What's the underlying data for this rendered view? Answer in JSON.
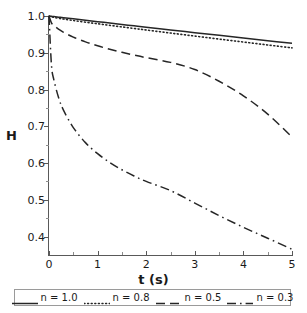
{
  "chart_data": {
    "type": "line",
    "title": "",
    "xlabel": "t (s)",
    "ylabel": "H",
    "xlim": [
      0,
      5
    ],
    "ylim": [
      0.35,
      1.0
    ],
    "grid": false,
    "legend_position": "bottom",
    "xticks": [
      "0",
      "1",
      "2",
      "3",
      "4",
      "5"
    ],
    "xtick_values": [
      0,
      1,
      2,
      3,
      4,
      5
    ],
    "yticks": [
      "0.4",
      "0.5",
      "0.6",
      "0.7",
      "0.8",
      "0.9",
      "1.0"
    ],
    "ytick_values": [
      0.4,
      0.5,
      0.6,
      0.7,
      0.8,
      0.9,
      1.0
    ],
    "x": [
      0,
      0.05,
      0.1,
      0.2,
      0.3,
      0.5,
      0.75,
      1.0,
      1.25,
      1.5,
      1.75,
      2.0,
      2.5,
      3.0,
      3.5,
      4.0,
      4.5,
      5.0
    ],
    "series": [
      {
        "name": "n = 1.0",
        "style": "solid",
        "color": "#262626",
        "values": [
          1.0,
          0.9992,
          0.9984,
          0.9969,
          0.9953,
          0.9922,
          0.9884,
          0.9846,
          0.9808,
          0.977,
          0.9732,
          0.9695,
          0.962,
          0.9547,
          0.9474,
          0.9401,
          0.9329,
          0.9258
        ]
      },
      {
        "name": "n = 0.8",
        "style": "dotted",
        "color": "#262626",
        "values": [
          1.0,
          0.9978,
          0.9963,
          0.9938,
          0.9917,
          0.9877,
          0.9832,
          0.9789,
          0.9746,
          0.9703,
          0.9661,
          0.9619,
          0.9536,
          0.9454,
          0.9372,
          0.9292,
          0.9212,
          0.9133
        ]
      },
      {
        "name": "n = 0.5",
        "style": "dashed",
        "color": "#262626",
        "values": [
          1.0,
          0.9815,
          0.9744,
          0.9639,
          0.9556,
          0.9427,
          0.9297,
          0.919,
          0.9097,
          0.9014,
          0.8938,
          0.8867,
          0.8739,
          0.8543,
          0.8225,
          0.7828,
          0.7332,
          0.6711
        ]
      },
      {
        "name": "n = 0.3",
        "style": "dashdot",
        "color": "#262626",
        "values": [
          1.0,
          0.8678,
          0.8265,
          0.7769,
          0.7434,
          0.6966,
          0.6556,
          0.6255,
          0.6016,
          0.5818,
          0.5649,
          0.5501,
          0.5252,
          0.4912,
          0.4571,
          0.4253,
          0.3957,
          0.3655
        ]
      }
    ],
    "legend_entries": [
      {
        "label": "n = 1.0",
        "style": "solid"
      },
      {
        "label": "n = 0.8",
        "style": "dotted"
      },
      {
        "label": "n = 0.5",
        "style": "dashed"
      },
      {
        "label": "n = 0.3",
        "style": "dashdot"
      }
    ],
    "axis_color": "#595959",
    "line_color": "#262626",
    "background": "#ffffff"
  }
}
